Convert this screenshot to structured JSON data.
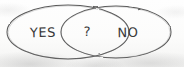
{
  "diagram": {
    "kind": "venn-diagram",
    "medium": "hand-drawn sketch on scanned paper",
    "background_color": "#fdfdfc",
    "ink_color": "#555555",
    "text_color": "#3a3a3a",
    "sets": [
      {
        "id": "yes",
        "label": "YES",
        "position": "left",
        "shape": "ellipse",
        "center_x": 68,
        "center_y": 32,
        "radius_x": 61,
        "radius_y": 27
      },
      {
        "id": "no",
        "label": "NO",
        "position": "right",
        "shape": "ellipse",
        "center_x": 116,
        "center_y": 32,
        "radius_x": 55,
        "radius_y": 26
      }
    ],
    "intersection": {
      "id": "overlap",
      "label": "?",
      "position": "center",
      "center_x": 87,
      "center_y": 32
    }
  }
}
